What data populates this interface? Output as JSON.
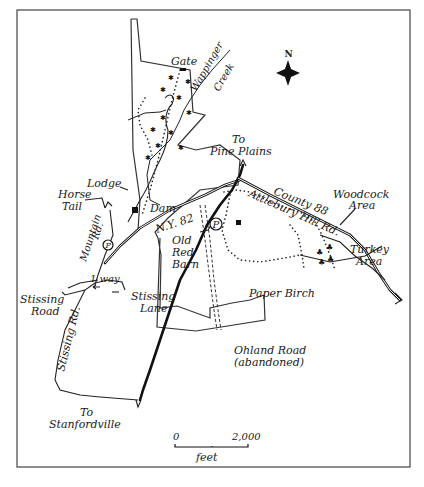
{
  "map": {
    "compass": {
      "label": "N",
      "icon": "north-star-icon"
    },
    "labels": {
      "gate": "Gate",
      "creek_line1": "Wappinger",
      "creek_line2": "Creek",
      "to_pine_plains_1": "To",
      "to_pine_plains_2": "Pine Plains",
      "lodge": "Lodge",
      "horse_tail_1": "Horse",
      "horse_tail_2": "Tail",
      "dam": "Dam",
      "mountain_rd_1": "Mountain",
      "mountain_rd_2": "Rd.",
      "ny82": "N.Y. 82",
      "county88": "County 88",
      "attlebury": "Attlebury Hill Rd.",
      "woodcock_1": "Woodcock",
      "woodcock_2": "Area",
      "turkey_1": "Turkey",
      "turkey_2": "Area",
      "old_red_barn_1": "Old",
      "old_red_barn_2": "Red",
      "old_red_barn_3": "Barn",
      "one_way": "1 way",
      "stissing_road_1": "Stissing",
      "stissing_road_2": "Road",
      "stissing_lane_1": "Stissing",
      "stissing_lane_2": "Lane",
      "paper_birch": "Paper Birch",
      "stissing_rd": "Stissing Rd.",
      "ohland_1": "Ohland Road",
      "ohland_2": "(abandoned)",
      "to_stanfordville_1": "To",
      "to_stanfordville_2": "Stanfordville",
      "parking": "P"
    },
    "scale": {
      "start": "0",
      "end": "2,000",
      "unit": "feet"
    }
  }
}
